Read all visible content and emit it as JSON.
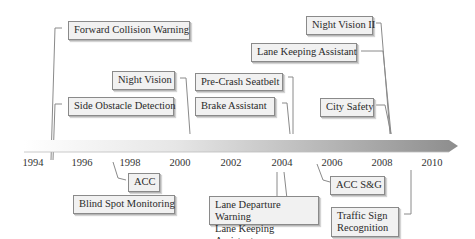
{
  "timeline": {
    "axis": {
      "years": [
        "1994",
        "1996",
        "1998",
        "2000",
        "2002",
        "2004",
        "2006",
        "2008",
        "2010"
      ],
      "gradient_start": "#ffffff",
      "gradient_end": "#9a9a9a"
    },
    "above": [
      {
        "id": "fcw",
        "label": "Forward Collision Warning"
      },
      {
        "id": "sod",
        "label": "Side Obstacle Detection"
      },
      {
        "id": "nv",
        "label": "Night Vision"
      },
      {
        "id": "pcs",
        "label": "Pre-Crash Seatbelt"
      },
      {
        "id": "ba",
        "label": "Brake Assistant"
      },
      {
        "id": "nv2",
        "label": "Night Vision II"
      },
      {
        "id": "lka_top",
        "label": "Lane Keeping Assistant"
      },
      {
        "id": "cs",
        "label": "City Safety"
      }
    ],
    "below": [
      {
        "id": "acc",
        "label": "ACC"
      },
      {
        "id": "bsm",
        "label": "Blind Spot Monitoring"
      },
      {
        "id": "ldw",
        "label": "Lane Departure Warning\nLane Keeping Assistant"
      },
      {
        "id": "accsg",
        "label": "ACC S&G"
      },
      {
        "id": "tsr",
        "label": "Traffic Sign\nRecognition"
      }
    ]
  }
}
